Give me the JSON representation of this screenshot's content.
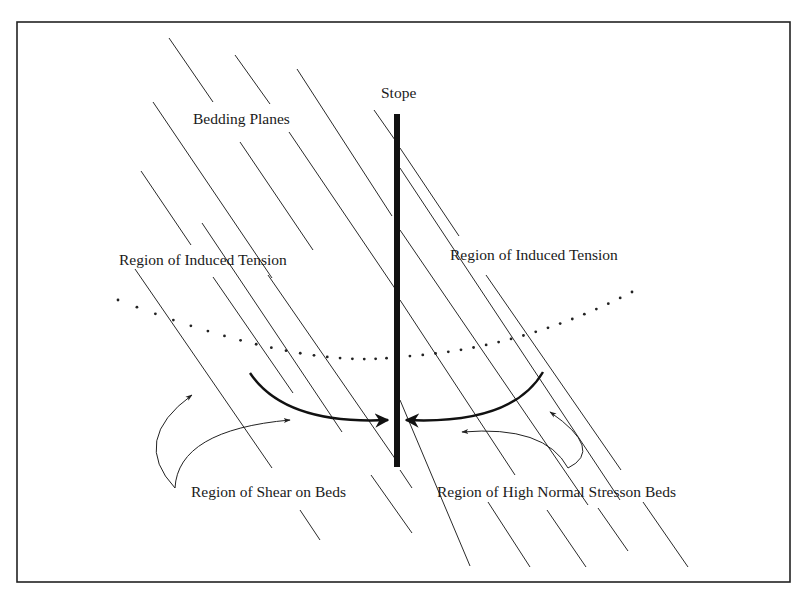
{
  "labels": {
    "stope": "Stope",
    "bedding_planes": "Bedding Planes",
    "tension_left": "Region of Induced Tension",
    "tension_right": "Region of Induced Tension",
    "shear": "Region of Shear on Beds",
    "normal_stress": "Region of High Normal Stresson Beds"
  },
  "colors": {
    "ink": "#111111",
    "background": "#ffffff"
  },
  "geometry": {
    "frame": {
      "x": 17,
      "y": 22,
      "w": 773,
      "h": 560
    },
    "stope": {
      "x": 394,
      "y": 114,
      "w": 6,
      "h": 353
    },
    "bedding_planes": [
      [
        [
          169,
          38
        ],
        [
          213,
          102
        ]
      ],
      [
        [
          235,
          55
        ],
        [
          270,
          104
        ]
      ],
      [
        [
          297,
          69
        ],
        [
          392,
          216
        ]
      ],
      [
        [
          374,
          110
        ],
        [
          395,
          140
        ]
      ],
      [
        [
          400,
          148
        ],
        [
          459,
          236
        ]
      ],
      [
        [
          153,
          102
        ],
        [
          272,
          278
        ]
      ],
      [
        [
          240,
          142
        ],
        [
          313,
          250
        ]
      ],
      [
        [
          289,
          132
        ],
        [
          396,
          290
        ]
      ],
      [
        [
          141,
          171
        ],
        [
          191,
          245
        ]
      ],
      [
        [
          202,
          223
        ],
        [
          342,
          432
        ]
      ],
      [
        [
          135,
          269
        ],
        [
          272,
          468
        ]
      ],
      [
        [
          213,
          277
        ],
        [
          293,
          393
        ]
      ],
      [
        [
          268,
          275
        ],
        [
          396,
          460
        ]
      ],
      [
        [
          400,
          300
        ],
        [
          515,
          475
        ]
      ],
      [
        [
          400,
          168
        ],
        [
          620,
          500
        ]
      ],
      [
        [
          400,
          230
        ],
        [
          588,
          505
        ]
      ],
      [
        [
          400,
          470
        ],
        [
          412,
          488
        ]
      ],
      [
        [
          486,
          275
        ],
        [
          621,
          470
        ]
      ],
      [
        [
          400,
          400
        ],
        [
          470,
          566
        ]
      ],
      [
        [
          488,
          502
        ],
        [
          530,
          567
        ]
      ],
      [
        [
          547,
          510
        ],
        [
          586,
          567
        ]
      ],
      [
        [
          598,
          508
        ],
        [
          628,
          551
        ]
      ],
      [
        [
          643,
          502
        ],
        [
          688,
          567
        ]
      ],
      [
        [
          300,
          510
        ],
        [
          320,
          540
        ]
      ],
      [
        [
          371,
          475
        ],
        [
          412,
          533
        ]
      ]
    ],
    "dotted_curve": {
      "start": [
        118,
        300
      ],
      "control": [
        300,
        370
      ],
      "mid": [
        397,
        357
      ],
      "control2": [
        520,
        350
      ],
      "end": [
        632,
        292
      ],
      "count": 38
    },
    "arrow_left_thick": "M 250 373 Q 285 425 388 420",
    "arrow_right_thick": "M 543 372 Q 512 425 406 420",
    "shear_arrow_a": "M 175 488 Q 130 440 192 395",
    "shear_arrow_b": "M 175 488 Q 178 430 290 420",
    "normal_arrow_a": "M 568 468 Q 605 450 550 412",
    "normal_arrow_b": "M 568 468 Q 545 425 462 432"
  }
}
